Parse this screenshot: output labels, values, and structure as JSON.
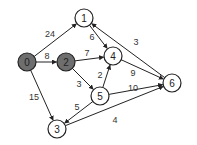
{
  "graph": {
    "type": "weighted directed graph",
    "nodes": [
      {
        "id": "0",
        "label": "0",
        "x": 27,
        "y": 62,
        "highlighted": true
      },
      {
        "id": "1",
        "label": "1",
        "x": 84,
        "y": 18,
        "highlighted": false
      },
      {
        "id": "2",
        "label": "2",
        "x": 66,
        "y": 62,
        "highlighted": true
      },
      {
        "id": "3",
        "label": "3",
        "x": 57,
        "y": 129,
        "highlighted": false
      },
      {
        "id": "4",
        "label": "4",
        "x": 113,
        "y": 56,
        "highlighted": false
      },
      {
        "id": "5",
        "label": "5",
        "x": 100,
        "y": 96,
        "highlighted": false
      },
      {
        "id": "6",
        "label": "6",
        "x": 172,
        "y": 83,
        "highlighted": false
      }
    ],
    "edges": [
      {
        "from": "0",
        "to": "1",
        "weight": "24",
        "lx": 50,
        "ly": 34
      },
      {
        "from": "0",
        "to": "2",
        "weight": "8",
        "lx": 47,
        "ly": 56
      },
      {
        "from": "0",
        "to": "3",
        "weight": "15",
        "lx": 34,
        "ly": 97
      },
      {
        "from": "2",
        "to": "4",
        "weight": "7",
        "lx": 87,
        "ly": 53
      },
      {
        "from": "2",
        "to": "5",
        "weight": "3",
        "lx": 79,
        "ly": 84
      },
      {
        "from": "1",
        "to": "4",
        "weight": "6",
        "lx": 92,
        "ly": 37
      },
      {
        "from": "6",
        "to": "1",
        "weight": "3",
        "lx": 136,
        "ly": 42
      },
      {
        "from": "5",
        "to": "4",
        "weight": "2",
        "lx": 100,
        "ly": 75
      },
      {
        "from": "4",
        "to": "6",
        "weight": "9",
        "lx": 133,
        "ly": 73
      },
      {
        "from": "5",
        "to": "6",
        "weight": "10",
        "lx": 133,
        "ly": 88
      },
      {
        "from": "5",
        "to": "3",
        "weight": "5",
        "lx": 77,
        "ly": 107
      },
      {
        "from": "3",
        "to": "6",
        "weight": "4",
        "lx": 115,
        "ly": 120
      }
    ],
    "colors": {
      "highlighted_node": "#6e6e6e",
      "normal_node": "#ffffff",
      "stroke": "#222222"
    }
  }
}
